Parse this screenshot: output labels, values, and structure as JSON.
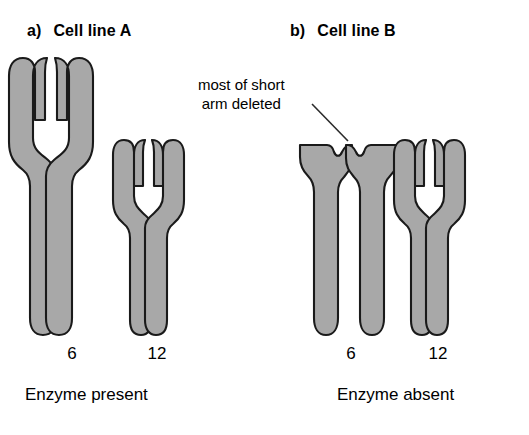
{
  "figure": {
    "background_color": "#ffffff",
    "chromosome_fill": "#a8a8a8",
    "chromosome_outline": "#1a1a1a"
  },
  "panels": [
    {
      "marker": "a)",
      "title": "Cell line A",
      "enzyme_caption": "Enzyme present",
      "chromosomes": [
        {
          "number": "6",
          "form": "normal-metacentric-large",
          "short_arm": "full"
        },
        {
          "number": "12",
          "form": "normal-metacentric-small",
          "short_arm": "full"
        }
      ]
    },
    {
      "marker": "b)",
      "title": "Cell line B",
      "enzyme_caption": "Enzyme absent",
      "chromosomes": [
        {
          "number": "6",
          "form": "deleted-short-arm",
          "short_arm": "mostly deleted"
        },
        {
          "number": "12",
          "form": "normal-metacentric-small",
          "short_arm": "full"
        }
      ]
    }
  ],
  "annotations": [
    {
      "id": "deletion-callout",
      "line1": "most of short",
      "line2": "arm deleted",
      "points_to": "cell line B chromosome 6 short arm"
    }
  ]
}
